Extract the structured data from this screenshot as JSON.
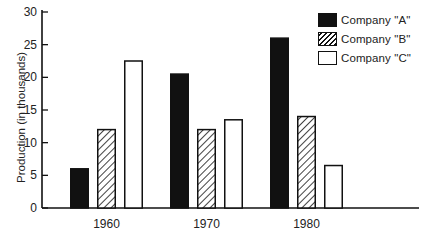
{
  "chart_data": {
    "type": "bar",
    "title": "",
    "xlabel": "",
    "ylabel": "Production (in thousands)",
    "categories": [
      "1960",
      "1970",
      "1980"
    ],
    "series": [
      {
        "name": "Company \"A\"",
        "style": "solid-black",
        "values": [
          6,
          20.5,
          26
        ]
      },
      {
        "name": "Company \"B\"",
        "style": "hatched",
        "values": [
          12,
          12,
          14
        ]
      },
      {
        "name": "Company \"C\"",
        "style": "white-outline",
        "values": [
          22.5,
          13.5,
          6.5
        ]
      }
    ],
    "ylim": [
      0,
      30
    ],
    "yticks": [
      0,
      5,
      10,
      15,
      20,
      25,
      30
    ],
    "grid": false,
    "legend_position": "top-right"
  },
  "legend": [
    {
      "label": "Company \"A\"",
      "style": "solid-black"
    },
    {
      "label": "Company \"B\"",
      "style": "hatched"
    },
    {
      "label": "Company \"C\"",
      "style": "white-outline"
    }
  ],
  "axis": {
    "ylabel": "Production (in thousands)",
    "yticks": [
      "0",
      "5",
      "10",
      "15",
      "20",
      "25",
      "30"
    ],
    "xticks": [
      "1960",
      "1970",
      "1980"
    ]
  },
  "colors": {
    "ink": "#111111",
    "background": "#ffffff"
  }
}
